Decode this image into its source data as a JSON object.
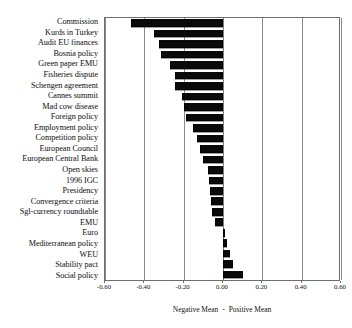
{
  "chart_data": {
    "type": "bar",
    "orientation": "horizontal",
    "title": "",
    "subtitle": "",
    "xlabel": "Negative Mean - Positive Mean",
    "ylabel": "",
    "xlim": [
      -0.6,
      0.6
    ],
    "xticks": [
      -0.6,
      -0.4,
      -0.2,
      0.0,
      0.2,
      0.4,
      0.6
    ],
    "xticklabels": [
      "-0.60",
      "-0.40",
      "-0.20",
      "0.00",
      "0.20",
      "0.40",
      "0.60"
    ],
    "grid": true,
    "grid_axis": "x",
    "legend": null,
    "bar_color": "#0a0a0a",
    "categories": [
      "Commission",
      "Kurds in Turkey",
      "Audit EU finances",
      "Bosnia policy",
      "Green paper EMU",
      "Fisheries dispute",
      "Schengen agreement",
      "Cannes summit",
      "Mad cow disease",
      "Foreign policy",
      "Employment policy",
      "Competition policy",
      "European Council",
      "European Central Bank",
      "Open skies",
      "1996 IGC",
      "Presidency",
      "Convergence criteria",
      "Sgl-currency roundtable",
      "EMU",
      "Euro",
      "Mediterranean policy",
      "WEU",
      "Stability pact",
      "Social policy"
    ],
    "values": [
      -0.47,
      -0.35,
      -0.325,
      -0.315,
      -0.27,
      -0.245,
      -0.245,
      -0.21,
      -0.2,
      -0.19,
      -0.155,
      -0.13,
      -0.115,
      -0.1,
      -0.075,
      -0.07,
      -0.065,
      -0.06,
      -0.055,
      -0.04,
      0.008,
      0.02,
      0.035,
      0.05,
      0.1
    ]
  },
  "axis_caption": {
    "negative_label": "Negative Mean",
    "separator": "-",
    "positive_label": "Positive Mean"
  }
}
